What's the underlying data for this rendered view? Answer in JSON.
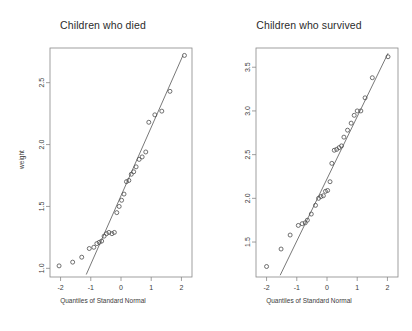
{
  "figure": {
    "background": "#ffffff",
    "point_color": "#4d4d4d",
    "line_color": "#555555",
    "axis_color": "#888888"
  },
  "panels": [
    {
      "id": "children-who-died",
      "title": "Children who died",
      "xlabel": "Quantiles of Standard Normal",
      "ylabel": "weight"
    },
    {
      "id": "children-who-survived",
      "title": "Children who survived",
      "xlabel": "Quantiles of Standard Normal",
      "ylabel": "weight"
    }
  ],
  "chart_data": [
    {
      "type": "scatter",
      "title": "Children who died",
      "xlabel": "Quantiles of Standard Normal",
      "ylabel": "weight",
      "xlim": [
        -2.35,
        2.35
      ],
      "ylim": [
        0.93,
        2.78
      ],
      "xticks": [
        -2,
        -1,
        0,
        1,
        2
      ],
      "xticklabels": [
        "-2",
        "-1",
        "0",
        "1",
        "2"
      ],
      "yticks": [
        1.0,
        1.5,
        2.0,
        2.5
      ],
      "yticklabels": [
        "1.0",
        "1.5",
        "2.0",
        "2.5"
      ],
      "grid": false,
      "legend": "none",
      "annotations": [
        "qq-reference-line"
      ],
      "reference_line": {
        "x": [
          -1.15,
          2.05
        ],
        "y": [
          0.95,
          2.72
        ]
      },
      "x": [
        -2.05,
        -1.6,
        -1.3,
        -1.05,
        -0.9,
        -0.8,
        -0.72,
        -0.64,
        -0.56,
        -0.48,
        -0.4,
        -0.3,
        -0.22,
        -0.14,
        -0.06,
        0.02,
        0.1,
        0.18,
        0.26,
        0.34,
        0.42,
        0.5,
        0.6,
        0.7,
        0.82,
        0.92,
        1.12,
        1.35,
        1.62,
        2.1
      ],
      "y": [
        1.02,
        1.05,
        1.09,
        1.16,
        1.17,
        1.2,
        1.21,
        1.22,
        1.26,
        1.28,
        1.29,
        1.28,
        1.29,
        1.45,
        1.5,
        1.55,
        1.6,
        1.7,
        1.71,
        1.76,
        1.78,
        1.82,
        1.88,
        1.9,
        1.94,
        2.18,
        2.24,
        2.27,
        2.43,
        2.72
      ]
    },
    {
      "type": "scatter",
      "title": "Children who survived",
      "xlabel": "Quantiles of Standard Normal",
      "ylabel": "weight",
      "xlim": [
        -2.35,
        2.35
      ],
      "ylim": [
        1.1,
        3.72
      ],
      "xticks": [
        -2,
        -1,
        0,
        1,
        2
      ],
      "xticklabels": [
        "-2",
        "-1",
        "0",
        "1",
        "2"
      ],
      "yticks": [
        1.5,
        2.0,
        2.5,
        3.0,
        3.5
      ],
      "yticklabels": [
        "1.5",
        "2.0",
        "2.5",
        "3.0",
        "3.5"
      ],
      "grid": false,
      "legend": "none",
      "annotations": [
        "qq-reference-line"
      ],
      "reference_line": {
        "x": [
          -1.55,
          2.02
        ],
        "y": [
          1.12,
          3.66
        ]
      },
      "x": [
        -2.0,
        -1.52,
        -1.22,
        -0.95,
        -0.82,
        -0.72,
        -0.65,
        -0.52,
        -0.38,
        -0.28,
        -0.2,
        -0.12,
        -0.05,
        0.02,
        0.1,
        0.16,
        0.24,
        0.32,
        0.4,
        0.48,
        0.56,
        0.68,
        0.8,
        0.9,
        1.0,
        1.12,
        1.26,
        1.5,
        2.02
      ],
      "y": [
        1.22,
        1.42,
        1.58,
        1.69,
        1.71,
        1.72,
        1.75,
        1.82,
        1.92,
        2.0,
        2.02,
        2.03,
        2.08,
        2.09,
        2.19,
        2.4,
        2.55,
        2.56,
        2.58,
        2.6,
        2.7,
        2.78,
        2.86,
        2.95,
        3.0,
        3.0,
        3.15,
        3.38,
        3.62
      ]
    }
  ]
}
